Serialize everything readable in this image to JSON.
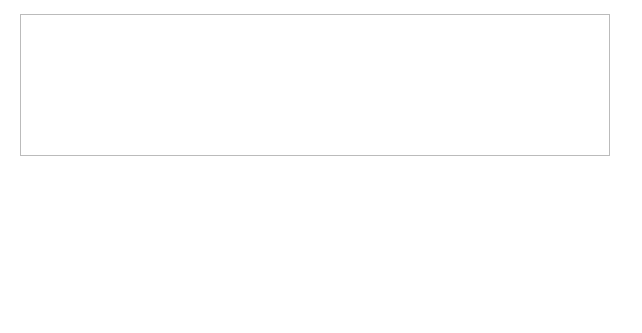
{
  "diagram": {
    "figure_label": "Figure 14.7",
    "caption_text": "The circular flow of income",
    "nodes": {
      "firms": "FIRMS",
      "households": "HOUSEHOLDS",
      "banks": "BANKS, etc.",
      "government": "GOVERNMENT",
      "abroad": "ABROAD"
    },
    "left_outflows": [
      "S",
      "M",
      "T"
    ],
    "left_inflows": [
      "I",
      "G",
      "X"
    ],
    "inner": {
      "factor_payments_1": "Factor",
      "factor_payments_2": "payments",
      "inner_flow": "INNER FLOW",
      "consumption_1": "Consumption of",
      "consumption_2": "domestically",
      "consumption_3": "produced goods",
      "consumption_4": "and services"
    },
    "injections": {
      "label": "INJECTIONS",
      "investment_text": "Investment ",
      "investment_sym": "I",
      "gov_line1": "Government",
      "gov_line2": "expenditure ",
      "gov_sym": "G",
      "export_line1": "Export",
      "export_line2": "expenditure ",
      "export_sym": "X"
    },
    "withdrawals": {
      "label": "WITHDRAWALS",
      "savings_text": "Savings ",
      "savings_sym": "S",
      "taxes_text": "Taxes ",
      "taxes_sym": "T",
      "import_line1": "Import",
      "import_line2": "expenditure ",
      "import_sym": "M"
    },
    "colors": {
      "building_fill": "#cfcfcf",
      "building_stroke": "#555555",
      "grey_arrow": "#9a9a9a",
      "black_arrow": "#111111",
      "frame": "#bbbbbb"
    }
  }
}
